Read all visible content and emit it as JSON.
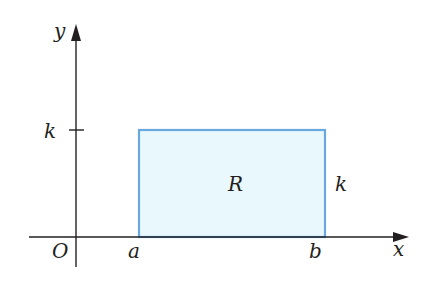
{
  "diagram": {
    "axes": {
      "x_label": "x",
      "y_label": "y",
      "origin_label": "O"
    },
    "region": {
      "label": "R",
      "fill": "#e8f8fc",
      "stroke": "#6aa9e0"
    },
    "ticks": {
      "y_tick_label": "k"
    },
    "x_points": {
      "a": "a",
      "b": "b"
    },
    "height_label": "k",
    "colors": {
      "axis": "#231f20"
    }
  }
}
